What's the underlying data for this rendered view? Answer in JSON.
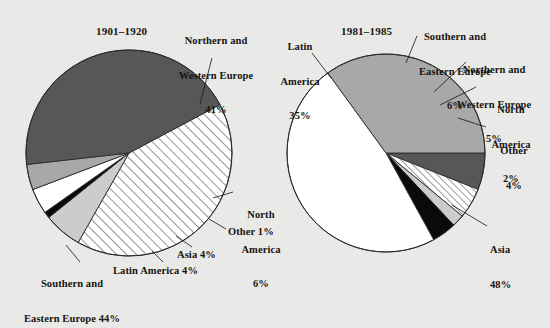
{
  "figure": {
    "name": "immigration-origin-pie-charts",
    "background_color": "#e9e9e7",
    "ink_color": "#17140f"
  },
  "palette": {
    "dark_gray": "#575757",
    "medium_gray": "#a8a8a8",
    "light_gray": "#cccccc",
    "black": "#0a0a0a",
    "white": "#ffffff",
    "hatch_stroke": "#3a3a3a",
    "outline": "#2b2b2b"
  },
  "chart_data": [
    {
      "type": "pie",
      "title": "1901–1920",
      "id": "pie-1901-1920",
      "center": [
        129,
        153
      ],
      "radius": 103,
      "start_angle_deg": -28,
      "direction": "clockwise",
      "categories": [
        "Northern and Western Europe",
        "North America",
        "Other",
        "Asia",
        "Latin America",
        "Southern and Eastern Europe"
      ],
      "values": [
        41,
        6,
        1,
        4,
        4,
        44
      ],
      "slices": [
        {
          "label": "Northern and\nWestern Europe\n41%",
          "name": "northern-western-europe",
          "value": 41,
          "fill": "hatch",
          "leader": true
        },
        {
          "label": "North\nAmerica\n6%",
          "name": "north-america",
          "value": 6,
          "fill": "light_gray",
          "leader": true
        },
        {
          "label": "Other 1%",
          "name": "other",
          "value": 1,
          "fill": "black",
          "leader": true
        },
        {
          "label": "Asia 4%",
          "name": "asia",
          "value": 4,
          "fill": "white",
          "leader": true
        },
        {
          "label": "Latin America 4%",
          "name": "latin-america",
          "value": 4,
          "fill": "medium_gray",
          "leader": true
        },
        {
          "label": "Southern and\nEastern Europe 44%",
          "name": "southern-eastern-europe",
          "value": 44,
          "fill": "dark_gray",
          "leader": true
        }
      ]
    },
    {
      "type": "pie",
      "title": "1981–1985",
      "id": "pie-1981-1985",
      "center": [
        386,
        153
      ],
      "radius": 99,
      "start_angle_deg": 0,
      "direction": "clockwise",
      "categories": [
        "Southern and Eastern Europe",
        "Northern and Western Europe",
        "North America",
        "Other",
        "Asia",
        "Latin America"
      ],
      "values": [
        6,
        5,
        2,
        4,
        48,
        35
      ],
      "slices": [
        {
          "label": "Southern and\nEastern Europe\n6%",
          "name": "southern-eastern-europe",
          "value": 6,
          "fill": "dark_gray",
          "leader": true
        },
        {
          "label": "Northern and\nWestern Europe\n5%",
          "name": "northern-western-europe",
          "value": 5,
          "fill": "hatch",
          "leader": true
        },
        {
          "label": "North\nAmerica\n2%",
          "name": "north-america",
          "value": 2,
          "fill": "light_gray",
          "leader": true
        },
        {
          "label": "Other\n4%",
          "name": "other",
          "value": 4,
          "fill": "black",
          "leader": true
        },
        {
          "label": "Asia\n48%",
          "name": "asia",
          "value": 48,
          "fill": "white",
          "leader": true
        },
        {
          "label": "Latin\nAmerica\n35%",
          "name": "latin-america",
          "value": 35,
          "fill": "medium_gray",
          "leader": true
        }
      ]
    }
  ],
  "labels": {
    "left": {
      "title": "1901–1920",
      "nw_europe_l1": "Northern and",
      "nw_europe_l2": "Western Europe",
      "nw_europe_l3": "41%",
      "n_america_l1": "North",
      "n_america_l2": "America",
      "n_america_l3": "6%",
      "other": "Other 1%",
      "asia": "Asia 4%",
      "latin_america": "Latin America 4%",
      "se_europe_l1": "Southern and",
      "se_europe_l2": "Eastern Europe 44%"
    },
    "right": {
      "title": "1981–1985",
      "latin_l1": "Latin",
      "latin_l2": "America",
      "latin_l3": "35%",
      "se_europe_l1": "Southern and",
      "se_europe_l2": "Eastern Europe",
      "se_europe_l3": "6%",
      "nw_europe_l1": "Northern and",
      "nw_europe_l2": "Western Europe",
      "nw_europe_l3": "5%",
      "n_america_l1": "North",
      "n_america_l2": "America",
      "n_america_l3": "2%",
      "other_l1": "Other",
      "other_l2": "4%",
      "asia_l1": "Asia",
      "asia_l2": "48%"
    }
  }
}
